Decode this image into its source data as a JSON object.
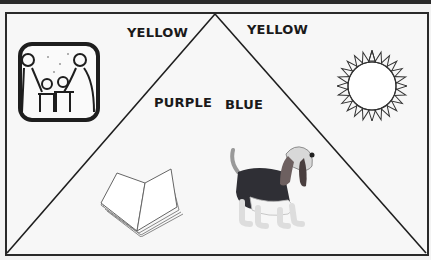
{
  "labels": {
    "top_left_yellow": "YELLOW",
    "purple": "PURPLE",
    "top_right_yellow": "YELLOW",
    "blue": "BLUE"
  },
  "pictures": [
    {
      "name": "family-picture",
      "description": "framed family holding hands"
    },
    {
      "name": "book-picture",
      "description": "open book"
    },
    {
      "name": "sun-picture",
      "description": "sun outline"
    },
    {
      "name": "dog-picture",
      "description": "basset hound"
    }
  ],
  "colors": {
    "line": "#1e1e1e",
    "background": "#f7f7f7"
  }
}
